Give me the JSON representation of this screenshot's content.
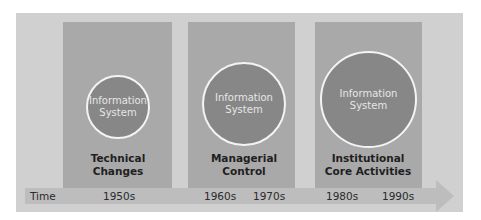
{
  "diagram": {
    "stages": [
      {
        "circle_line1": "Information",
        "circle_line2": "System",
        "label_line1": "Technical",
        "label_line2": "Changes"
      },
      {
        "circle_line1": "Information",
        "circle_line2": "System",
        "label_line1": "Managerial",
        "label_line2": "Control"
      },
      {
        "circle_line1": "Information",
        "circle_line2": "System",
        "label_line1": "Institutional",
        "label_line2": "Core Activities"
      }
    ],
    "timeline": {
      "label": "Time",
      "ticks": [
        "1950s",
        "1960s",
        "1970s",
        "1980s",
        "1990s"
      ]
    },
    "colors": {
      "background": "#d0d0d0",
      "column": "#a9a9a9",
      "circle": "#878787",
      "timebar": "#bdbdbd"
    }
  }
}
